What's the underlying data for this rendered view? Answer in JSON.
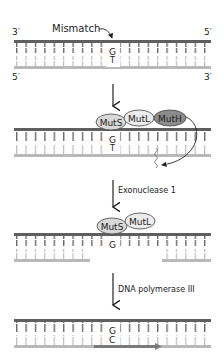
{
  "colors": {
    "template_strand": "#5f5f5f",
    "daughter_strand": "#b9b9b9",
    "new_strand": "#7a7a7a",
    "protein_fill_light": "#e6e6e6",
    "protein_fill_dark": "#8c8c8c",
    "text": "#222222"
  },
  "panel1": {
    "end_top_left": "3′",
    "end_top_right": "5′",
    "end_bottom_left": "5′",
    "end_bottom_right": "3′",
    "mismatch_label": "Mismatch",
    "base_top": "G",
    "base_bottom": "T"
  },
  "panel2": {
    "proteins": [
      "MutS",
      "MutL",
      "MutH"
    ],
    "base_top": "G",
    "base_bottom": "T"
  },
  "step2": {
    "label": "Exonuclease 1"
  },
  "panel3": {
    "proteins": [
      "MutS",
      "MutL"
    ],
    "base_top": "G"
  },
  "step3": {
    "label": "DNA polymerase III"
  },
  "panel4": {
    "base_top": "G",
    "base_bottom": "C"
  }
}
